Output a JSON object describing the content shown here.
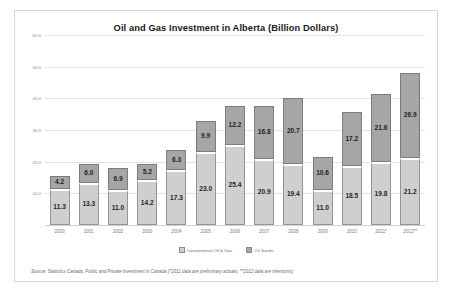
{
  "chart_data": {
    "type": "bar",
    "stacked": true,
    "title": "Oil and Gas Investment in Alberta (Billion Dollars)",
    "xlabel": "",
    "ylabel": "",
    "ylim": [
      0,
      60
    ],
    "ytick_labels": [
      "60.0",
      "50.0",
      "40.0",
      "30.0",
      "20.0",
      "10.0",
      "-"
    ],
    "ytick_values": [
      60,
      50,
      40,
      30,
      20,
      10,
      0
    ],
    "grid": true,
    "legend_position": "bottom",
    "categories": [
      "2000",
      "2001",
      "2002",
      "2003",
      "2004",
      "2005",
      "2006",
      "2007",
      "2008",
      "2009",
      "2010",
      "2011*",
      "2012**"
    ],
    "series": [
      {
        "name": "Conventional Oil & Gas",
        "color": "#cfcfcf",
        "values": [
          11.3,
          13.3,
          11.0,
          14.2,
          17.3,
          23.0,
          25.4,
          20.9,
          19.4,
          11.0,
          18.5,
          19.8,
          21.2
        ]
      },
      {
        "name": "Oil Sands",
        "color": "#a6a6a6",
        "values": [
          4.2,
          6.0,
          6.9,
          5.2,
          6.3,
          9.9,
          12.2,
          16.8,
          20.7,
          10.6,
          17.2,
          21.6,
          26.9
        ]
      }
    ],
    "source_note": "Source: Statistics Canada, Public and Private Investment in Canada (*2011 data are preliminary actuals, **2012 data  are intentions)"
  }
}
